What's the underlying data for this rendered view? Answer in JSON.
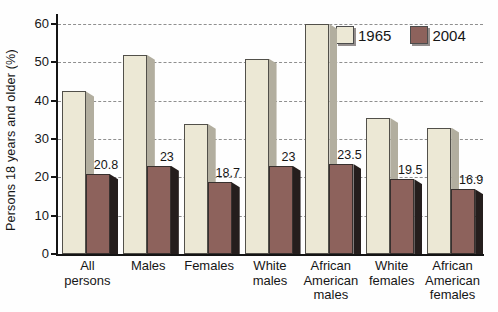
{
  "figure": {
    "background": "#fefefe",
    "text_color": "#161616",
    "grid_color": "#8f8f8f",
    "axis_color": "#141414"
  },
  "chart_data": {
    "type": "bar",
    "title": "",
    "xlabel": "",
    "ylabel": "Persons 18 years and older (%)",
    "ylim": [
      0,
      60
    ],
    "yticks": [
      0,
      10,
      20,
      30,
      40,
      50,
      60
    ],
    "grid": "horizontal-dashed",
    "legend_position": "top-right",
    "style": "3d-beveled-bars",
    "categories": [
      "All persons",
      "Males",
      "Females",
      "White males",
      "African American males",
      "White females",
      "African American females"
    ],
    "category_label_lines": [
      [
        "All",
        "persons"
      ],
      [
        "Males"
      ],
      [
        "Females"
      ],
      [
        "White",
        "males"
      ],
      [
        "African",
        "American",
        "males"
      ],
      [
        "White",
        "females"
      ],
      [
        "African",
        "American",
        "females"
      ]
    ],
    "series": [
      {
        "name": "1965",
        "color_front": "#ece8d5",
        "color_side": "#b2ae9f",
        "color_border": "#52504a",
        "values": [
          42.4,
          52,
          34,
          51,
          60,
          35.5,
          33
        ],
        "value_labels": [
          "",
          "",
          "",
          "",
          "",
          "",
          ""
        ]
      },
      {
        "name": "2004",
        "color_front": "#8d625c",
        "color_side": "#251e1d",
        "color_border": "#38302e",
        "values": [
          20.8,
          23,
          18.7,
          23,
          23.5,
          19.5,
          16.9
        ],
        "value_labels": [
          "20.8",
          "23",
          "18.7",
          "23",
          "23.5",
          "19.5",
          "16.9"
        ]
      }
    ]
  }
}
